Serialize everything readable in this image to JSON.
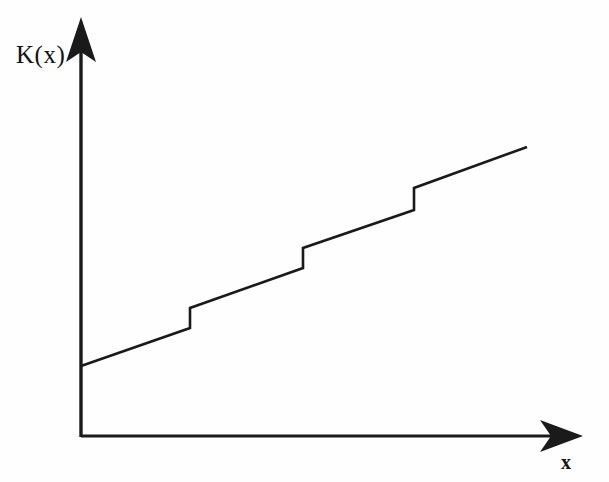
{
  "figure": {
    "kind": "step-function-plot",
    "background_color": "#fefefe",
    "ink_color": "#1a1a1a",
    "width": 609,
    "height": 482
  },
  "axes": {
    "y_label": "K(x)",
    "x_label": "x",
    "origin": {
      "x": 81,
      "y": 437
    },
    "y_axis_top": {
      "x": 81,
      "y": 17
    },
    "x_axis_right": {
      "x": 583,
      "y": 437
    },
    "stroke_width": 3,
    "arrow_style": "solid-barbed"
  },
  "chart_data": {
    "type": "line",
    "title": "",
    "xlabel": "x",
    "ylabel": "K(x)",
    "grid": false,
    "legend": null,
    "xlim": [
      0,
      1
    ],
    "ylim": [
      0,
      1
    ],
    "axis_ticks": {
      "x": [],
      "y": []
    },
    "series": [
      {
        "name": "K(x)",
        "style": "solid",
        "color": "#1a1a1a",
        "width": 2.6,
        "segments": [
          {
            "index": 0,
            "x0": 81,
            "y0": 366,
            "x1": 190,
            "y1": 328
          },
          {
            "index": 1,
            "x0": 190,
            "y0": 308,
            "x1": 303,
            "y1": 268
          },
          {
            "index": 2,
            "x0": 303,
            "y0": 248,
            "x1": 414,
            "y1": 210
          },
          {
            "index": 3,
            "x0": 414,
            "y0": 188,
            "x1": 527,
            "y1": 147
          }
        ],
        "jumps": [
          {
            "index": 0,
            "x": 190,
            "y_from": 328,
            "y_to": 308,
            "height": 20
          },
          {
            "index": 1,
            "x": 303,
            "y_from": 268,
            "y_to": 248,
            "height": 20
          },
          {
            "index": 2,
            "x": 414,
            "y_from": 210,
            "y_to": 188,
            "height": 22
          }
        ],
        "start_point": {
          "x": 81,
          "y": 366
        },
        "end_point": {
          "x": 527,
          "y": 147
        }
      }
    ],
    "path_points": [
      [
        81,
        366
      ],
      [
        190,
        328
      ],
      [
        190,
        308
      ],
      [
        303,
        268
      ],
      [
        303,
        248
      ],
      [
        414,
        210
      ],
      [
        414,
        188
      ],
      [
        527,
        147
      ]
    ]
  }
}
